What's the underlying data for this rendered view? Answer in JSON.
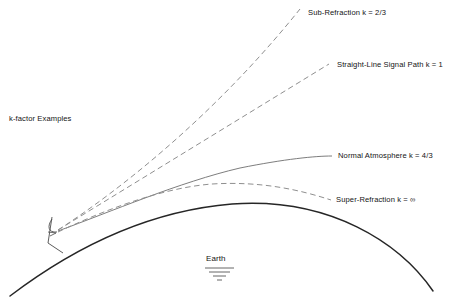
{
  "diagram": {
    "title_label": "k-factor Examples",
    "earth_label": "Earth",
    "ground_symbol_name": "earth-ground-symbol",
    "stroke_colors": {
      "earth_curve": "#262626",
      "dashed_ray": "#8a8a8a",
      "solid_ray": "#6e6e6e",
      "antenna_marker": "#4a4a4a",
      "text": "#141414"
    },
    "paths": [
      {
        "id": "sub-refraction",
        "label": "Sub-Refraction k = 2/3",
        "k_value": "2/3",
        "style": "dashed",
        "label_x": 308,
        "label_y": 9
      },
      {
        "id": "straight-line",
        "label": "Straight-Line Signal Path k = 1",
        "k_value": "1",
        "style": "dashed",
        "label_x": 337,
        "label_y": 61
      },
      {
        "id": "normal-atmosphere",
        "label": "Normal Atmosphere k = 4/3",
        "k_value": "4/3",
        "style": "solid",
        "label_x": 338,
        "label_y": 152
      },
      {
        "id": "super-refraction",
        "label": "Super-Refraction k = ∞",
        "k_value": "∞",
        "style": "dashed",
        "label_x": 336,
        "label_y": 196
      }
    ],
    "origin": {
      "x": 56,
      "y": 233,
      "name": "transmitter-origin"
    }
  }
}
